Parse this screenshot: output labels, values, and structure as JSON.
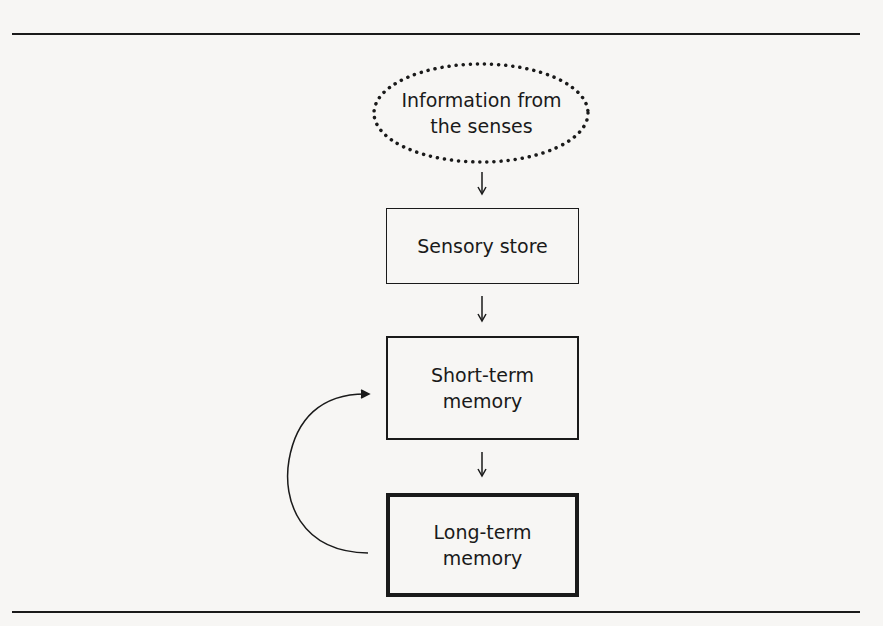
{
  "diagram": {
    "type": "flowchart",
    "title": "",
    "nodes": [
      {
        "id": "senses",
        "label_line1": "Information from",
        "label_line2": "the senses",
        "shape": "dotted-ellipse"
      },
      {
        "id": "sensory",
        "label": "Sensory store",
        "shape": "thin-box"
      },
      {
        "id": "stm",
        "label_line1": "Short-term",
        "label_line2": "memory",
        "shape": "medium-box"
      },
      {
        "id": "ltm",
        "label_line1": "Long-term",
        "label_line2": "memory",
        "shape": "thick-box"
      }
    ],
    "edges": [
      {
        "from": "senses",
        "to": "sensory"
      },
      {
        "from": "sensory",
        "to": "stm"
      },
      {
        "from": "stm",
        "to": "ltm"
      },
      {
        "from": "ltm",
        "to": "stm",
        "style": "curved-left"
      }
    ]
  }
}
